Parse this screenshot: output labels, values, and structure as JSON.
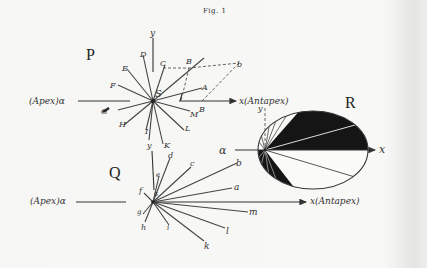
{
  "figure": {
    "title": "Fig. 1",
    "panels": {
      "P": {
        "label": "P",
        "center_label": "S",
        "apex_label": "(Apex)α",
        "antapex_label": "x(Antapex)",
        "y_axis_label": "y",
        "y_axis_label_bottom": "y",
        "ray_labels": [
          "A",
          "B",
          "C",
          "D",
          "E",
          "F",
          "G",
          "H",
          "I",
          "K",
          "L",
          "M"
        ],
        "parallelogram_labels": [
          "B",
          "b"
        ]
      },
      "Q": {
        "label": "Q",
        "center_label": "s",
        "apex_label": "(Apex)α",
        "antapex_label": "x(Antapex)",
        "y_axis_label": "y",
        "ray_labels": [
          "a",
          "b",
          "c",
          "d",
          "e",
          "f",
          "g",
          "h",
          "i",
          "k",
          "l",
          "m"
        ]
      },
      "R": {
        "label": "R",
        "alpha_label": "α",
        "x_label": "x",
        "y_label": "y"
      }
    }
  }
}
